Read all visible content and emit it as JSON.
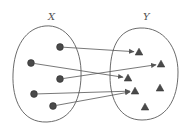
{
  "diagram": {
    "type": "function-mapping",
    "sets": [
      {
        "id": "X",
        "label": "X",
        "shape": "ellipse",
        "element_marker": "circle",
        "elements": [
          {
            "id": "x1",
            "x": 60,
            "y": 47
          },
          {
            "id": "x2",
            "x": 31,
            "y": 63
          },
          {
            "id": "x3",
            "x": 60,
            "y": 79
          },
          {
            "id": "x4",
            "x": 34,
            "y": 94
          },
          {
            "id": "x5",
            "x": 53,
            "y": 106
          }
        ]
      },
      {
        "id": "Y",
        "label": "Y",
        "shape": "ellipse",
        "element_marker": "triangle",
        "elements": [
          {
            "id": "y1",
            "x": 139,
            "y": 52
          },
          {
            "id": "y2",
            "x": 161,
            "y": 64
          },
          {
            "id": "y3",
            "x": 128,
            "y": 78
          },
          {
            "id": "y4",
            "x": 135,
            "y": 91
          },
          {
            "id": "y5",
            "x": 160,
            "y": 88
          },
          {
            "id": "y6",
            "x": 145,
            "y": 107
          }
        ]
      }
    ],
    "mappings": [
      {
        "from": "x1",
        "to": "y1"
      },
      {
        "from": "x2",
        "to": "y3"
      },
      {
        "from": "x3",
        "to": "y2"
      },
      {
        "from": "x4",
        "to": "y4"
      },
      {
        "from": "x5",
        "to": "y4"
      }
    ],
    "colors": {
      "marker_fill": "#4a4a4a",
      "stroke": "#5a5a5a",
      "label": "#555555"
    }
  }
}
